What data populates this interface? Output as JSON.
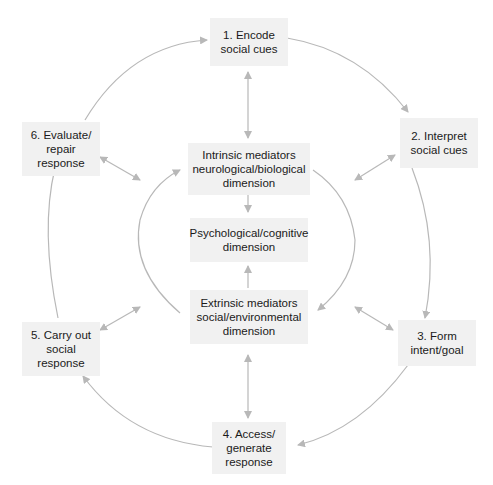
{
  "diagram": {
    "outer_steps": [
      {
        "id": "step1",
        "lines": [
          "1. Encode",
          "social cues"
        ]
      },
      {
        "id": "step2",
        "lines": [
          "2. Interpret",
          "social cues"
        ]
      },
      {
        "id": "step3",
        "lines": [
          "3. Form",
          "intent/goal"
        ]
      },
      {
        "id": "step4",
        "lines": [
          "4. Access/",
          "generate",
          "response"
        ]
      },
      {
        "id": "step5",
        "lines": [
          "5. Carry out",
          "social",
          "response"
        ]
      },
      {
        "id": "step6",
        "lines": [
          "6. Evaluate/",
          "repair",
          "response"
        ]
      }
    ],
    "inner_boxes": [
      {
        "id": "intrinsic",
        "lines": [
          "Intrinsic mediators",
          "neurological/biological",
          "dimension"
        ]
      },
      {
        "id": "psychological",
        "lines": [
          "Psychological/cognitive",
          "dimension"
        ]
      },
      {
        "id": "extrinsic",
        "lines": [
          "Extrinsic mediators",
          "social/environmental",
          "dimension"
        ]
      }
    ],
    "colors": {
      "box_fill": "#f1f1f1",
      "arrow": "#b8b8b8",
      "text": "#1a1a1a"
    }
  }
}
